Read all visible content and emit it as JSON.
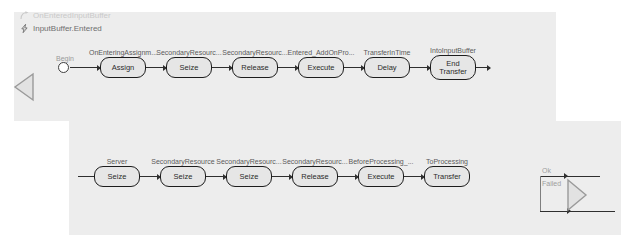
{
  "header": {
    "trigger": {
      "icon": "arrow-curve-icon",
      "label": "OnEnteredInputBuffer"
    },
    "event": {
      "icon": "lightning-bolt-icon",
      "label": "InputBuffer.Entered"
    }
  },
  "colors": {
    "panel_background": "#ededed",
    "canvas_background": "#ffffff",
    "node_fill": "#e6e6e6",
    "node_border": "#1d1d1d",
    "connector": "#2f2f2f",
    "caption_text": "#5a5a5a",
    "muted_text": "#9d9d9d",
    "disabled_text": "#c9c9c9"
  },
  "flow_top": {
    "start": {
      "label": "Begin"
    },
    "steps": [
      {
        "caption": "OnEnteringAssignm...",
        "label": "Assign"
      },
      {
        "caption": "SecondaryResourc...",
        "label": "Seize"
      },
      {
        "caption": "SecondaryResourc...",
        "label": "Release"
      },
      {
        "caption": "Entered_AddOnPro...",
        "label": "Execute"
      },
      {
        "caption": "TransferInTime",
        "label": "Delay"
      },
      {
        "caption": "IntoInputBuffer",
        "label": "End\nTransfer"
      }
    ]
  },
  "flow_bottom": {
    "steps": [
      {
        "caption": "Server",
        "label": "Seize"
      },
      {
        "caption": "SecondaryResource",
        "label": "Seize"
      },
      {
        "caption": "SecondaryResourc...",
        "label": "Seize"
      },
      {
        "caption": "SecondaryResourc...",
        "label": "Release"
      },
      {
        "caption": "BeforeProcessing_...",
        "label": "Execute"
      },
      {
        "caption": "ToProcessing",
        "label": "Transfer"
      }
    ],
    "branch": {
      "ok_label": "Ok",
      "failed_label": "Failed"
    }
  },
  "markers": {
    "left_triangle": "collapse-left-triangle-icon",
    "right_triangle": "expand-right-triangle-icon"
  }
}
